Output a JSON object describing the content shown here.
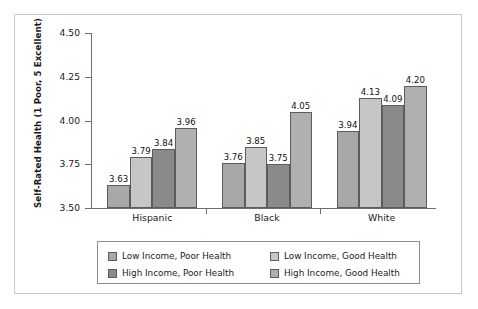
{
  "chart_data": {
    "type": "bar",
    "title": "",
    "xlabel": "",
    "ylabel": "Self-Rated Health (1 Poor, 5 Excellent)",
    "categories": [
      "Hispanic",
      "Black",
      "White"
    ],
    "ylim": [
      3.5,
      4.5
    ],
    "yticks": [
      "3.50",
      "3.75",
      "4.00",
      "4.25",
      "4.50"
    ],
    "grid": false,
    "legend_position": "bottom",
    "series": [
      {
        "name": "Low Income, Poor Health",
        "color": "#a8a8a8",
        "values": [
          3.63,
          3.76,
          3.94
        ],
        "labels": [
          "3.63",
          "3.76",
          "3.94"
        ]
      },
      {
        "name": "Low Income, Good Health",
        "color": "#c6c6c6",
        "values": [
          3.79,
          3.85,
          4.13
        ],
        "labels": [
          "3.79",
          "3.85",
          "4.13"
        ]
      },
      {
        "name": "High Income, Poor Health",
        "color": "#8a8a8a",
        "values": [
          3.84,
          3.75,
          4.09
        ],
        "labels": [
          "3.84",
          "3.75",
          "4.09"
        ]
      },
      {
        "name": "High Income, Good Health",
        "color": "#b0b0b0",
        "values": [
          3.96,
          4.05,
          4.2
        ],
        "labels": [
          "3.96",
          "4.05",
          "4.20"
        ]
      }
    ]
  },
  "axis": {
    "y_title": "Self-Rated Health (1 Poor, 5 Excellent)",
    "y_ticks": [
      "4.50",
      "4.25",
      "4.00",
      "3.75",
      "3.50"
    ],
    "x_categories": [
      "Hispanic",
      "Black",
      "White"
    ]
  },
  "legend": {
    "items": [
      {
        "label": "Low Income, Poor Health"
      },
      {
        "label": "Low Income, Good Health"
      },
      {
        "label": "High Income, Poor Health"
      },
      {
        "label": "High Income, Good Health"
      }
    ]
  }
}
